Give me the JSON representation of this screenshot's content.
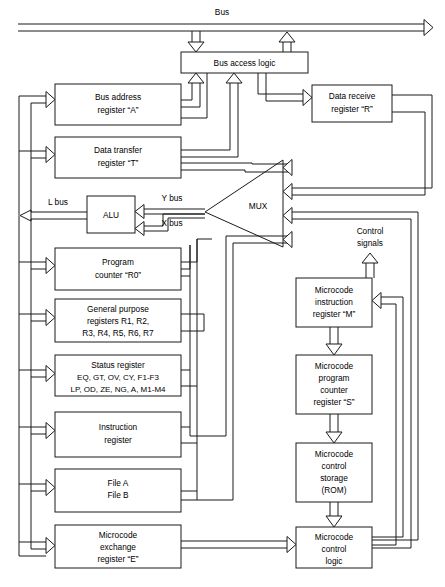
{
  "diagram": {
    "bus_label": "Bus",
    "blocks": {
      "bus_access_logic": {
        "lines": [
          "Bus access logic"
        ]
      },
      "bus_address_register": {
        "lines": [
          "Bus address",
          "register “A”"
        ]
      },
      "data_transfer_register": {
        "lines": [
          "Data transfer",
          "register “T”"
        ]
      },
      "data_receive_register": {
        "lines": [
          "Data receive",
          "register “R”"
        ]
      },
      "alu": {
        "lines": [
          "ALU"
        ]
      },
      "mux": {
        "lines": [
          "MUX"
        ]
      },
      "program_counter": {
        "lines": [
          "Program",
          "counter “R0”"
        ]
      },
      "general_purpose_registers": {
        "lines": [
          "General purpose",
          "registers R1, R2,",
          "R3, R4, R5, R6, R7"
        ]
      },
      "status_register": {
        "lines": [
          "Status register",
          "EQ, GT, OV, CY, F1-F3",
          "LP, OD, ZE, NG, A, M1-M4"
        ]
      },
      "instruction_register": {
        "lines": [
          "Instruction",
          "register"
        ]
      },
      "file_ab": {
        "lines": [
          "File A",
          "File B"
        ]
      },
      "microcode_exchange_register": {
        "lines": [
          "Microcode",
          "exchange",
          "register “E”"
        ]
      },
      "microcode_instruction_register": {
        "lines": [
          "Microcode",
          "instruction",
          "register “M”"
        ]
      },
      "microcode_program_counter": {
        "lines": [
          "Microcode",
          "program",
          "counter",
          "register “S”"
        ]
      },
      "microcode_control_storage": {
        "lines": [
          "Microcode",
          "control",
          "storage",
          "(ROM)"
        ]
      },
      "microcode_control_logic": {
        "lines": [
          "Microcode",
          "control",
          "logic"
        ]
      }
    },
    "wire_labels": {
      "y_bus": "Y bus",
      "x_bus": "X bus",
      "l_bus": "L bus",
      "control_signals_line1": "Control",
      "control_signals_line2": "signals"
    },
    "colors": {
      "ink": "#1a1a1a",
      "paper": "#ffffff"
    }
  }
}
